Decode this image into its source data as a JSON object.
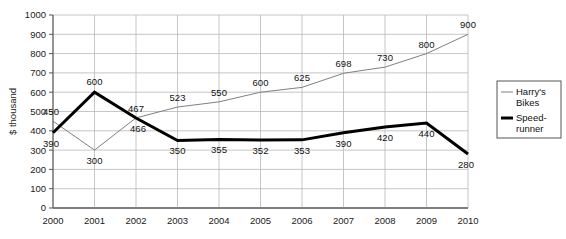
{
  "chart_data": {
    "type": "line",
    "title": "",
    "xlabel": "",
    "ylabel": "$ thousand",
    "categories": [
      "2000",
      "2001",
      "2002",
      "2003",
      "2004",
      "2005",
      "2006",
      "2007",
      "2008",
      "2009",
      "2010"
    ],
    "ylim": [
      0,
      1000
    ],
    "yticks": [
      "0",
      "100",
      "200",
      "300",
      "400",
      "500",
      "600",
      "700",
      "800",
      "900",
      "1000"
    ],
    "grid": true,
    "legend_position": "right",
    "series": [
      {
        "name": "Harry's Bikes",
        "color": "#808080",
        "line_width": 1,
        "values": [
          450,
          300,
          467,
          523,
          550,
          600,
          625,
          698,
          730,
          800,
          900
        ],
        "labels": [
          "450",
          "300",
          "467",
          "523",
          "550",
          "600",
          "625",
          "698",
          "730",
          "800",
          "900"
        ]
      },
      {
        "name": "Speed-runner",
        "color": "#000000",
        "line_width": 3,
        "values": [
          390,
          600,
          466,
          350,
          355,
          352,
          353,
          390,
          420,
          440,
          280
        ],
        "labels": [
          "390",
          "600",
          "466",
          "350",
          "355",
          "352",
          "353",
          "390",
          "420",
          "440",
          "280"
        ]
      }
    ]
  },
  "legend": {
    "entries": [
      {
        "label_line1": "Harry's",
        "label_line2": "Bikes"
      },
      {
        "label_line1": "Speed-",
        "label_line2": "runner"
      }
    ]
  },
  "axes": {
    "y_axis_title": "$ thousand"
  }
}
